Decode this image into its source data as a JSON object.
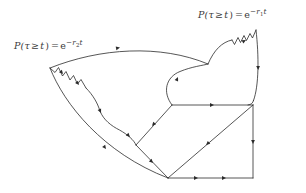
{
  "figure": {
    "kind": "spacetime-causal-diagram",
    "background_color": "#ffffff",
    "stroke_color": "#2b2b2b",
    "stroke_width": 0.8,
    "width": 306,
    "height": 193,
    "labels": {
      "right": {
        "name": "survival-probability-r1",
        "prefix": "P(",
        "variable": "τ",
        "relation": "≥",
        "time": "t",
        "equals": "=",
        "base": "e",
        "exponent_sign": "−",
        "exponent_rate": "r",
        "exponent_rate_index": "1",
        "exponent_time": "t",
        "text": "P(τ ≥ t) = e−r1t",
        "anchor_x": 198,
        "anchor_y": 9
      },
      "left": {
        "name": "survival-probability-r2",
        "prefix": "P(",
        "variable": "τ",
        "relation": "≥",
        "time": "t",
        "equals": "=",
        "base": "e",
        "exponent_sign": "−",
        "exponent_rate": "r",
        "exponent_rate_index": "2",
        "exponent_time": "t",
        "text": "P(τ ≥ t) = e−r2t",
        "anchor_x": 14,
        "anchor_y": 40
      }
    },
    "vertices": {
      "left_top": [
        50,
        68
      ],
      "cusp_top_middle": [
        208,
        64
      ],
      "right_top": [
        256,
        30
      ],
      "right_upper_bend": [
        253,
        100
      ],
      "right_corner": [
        253,
        105
      ],
      "right_bottom": [
        253,
        178
      ],
      "bottom_apex": [
        168,
        178
      ],
      "mid_left": [
        136,
        145
      ],
      "lower_left_of_box": [
        172,
        105
      ],
      "bottom_left_arc_end": [
        168,
        178
      ]
    },
    "paths": {
      "top_smooth_arc": "M 50 68 C 100 48 160 44 208 64",
      "right_scallop_1": "M 208 64 C 214 50 222 42 232 40",
      "right_scallop_zigzag": "M 232 40 L 234 44 L 238 38 L 240 43 L 244 36 L 246 41 L 250 34 L 252 38 L 256 30",
      "right_side_edge": "M 256 30 C 258 56 258 84 253 100",
      "right_round_corner": "M 253 100 C 252 103 251 104 247 105",
      "inner_round_blob": "M 172 105 C 164 92 166 78 180 72 C 192 67 202 66 208 64",
      "left_scallop_zigzag": "M 50 68 L 55 72 L 58 68 L 62 76 L 66 72 L 70 80 L 74 76 L 78 84 L 82 80 L 86 88",
      "left_scallop_arcs": "M 86 88 C 94 96 98 104 100 112 C 104 120 112 126 120 130 C 128 134 134 140 136 145",
      "left_outer_arc": "M 50 68 C 66 104 104 152 168 178",
      "box_top": "M 172 105 L 253 105",
      "box_right": "M 253 105 L 253 178",
      "box_bottom": "M 168 178 L 253 178",
      "diagonal_se": "M 253 105 L 168 178",
      "diagonal_nw": "M 172 105 L 136 145",
      "diagonal_sw": "M 136 145 L 168 178"
    },
    "arrow_markers": [
      {
        "name": "arrow-top-arc",
        "x": 118,
        "y": 48,
        "angle": -12
      },
      {
        "name": "arrow-right-scallop",
        "x": 222,
        "y": 44,
        "angle": -50
      },
      {
        "name": "arrow-right-side",
        "x": 257,
        "y": 68,
        "angle": 88
      },
      {
        "name": "arrow-inner-blob",
        "x": 178,
        "y": 78,
        "angle": -62
      },
      {
        "name": "arrow-left-zigzag",
        "x": 64,
        "y": 75,
        "angle": 48
      },
      {
        "name": "arrow-left-scallop-a",
        "x": 92,
        "y": 94,
        "angle": 52
      },
      {
        "name": "arrow-left-scallop-b",
        "x": 120,
        "y": 130,
        "angle": 40
      },
      {
        "name": "arrow-left-outer-arc",
        "x": 105,
        "y": 148,
        "angle": 52
      },
      {
        "name": "arrow-box-top",
        "x": 212,
        "y": 105,
        "angle": 0
      },
      {
        "name": "arrow-box-right",
        "x": 253,
        "y": 142,
        "angle": 90
      },
      {
        "name": "arrow-box-bottom-a",
        "x": 196,
        "y": 178,
        "angle": 0
      },
      {
        "name": "arrow-box-bottom-b",
        "x": 224,
        "y": 178,
        "angle": 0
      },
      {
        "name": "arrow-diagonal-se",
        "x": 210,
        "y": 142,
        "angle": 140
      },
      {
        "name": "arrow-diagonal-nw",
        "x": 154,
        "y": 125,
        "angle": 132
      },
      {
        "name": "arrow-diagonal-sw",
        "x": 152,
        "y": 162,
        "angle": 46
      }
    ]
  }
}
